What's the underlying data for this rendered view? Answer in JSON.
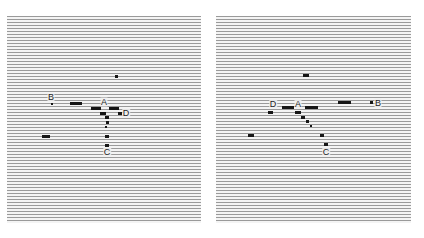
{
  "figure": {
    "panels": [
      {
        "name": "left",
        "labels": [
          {
            "id": "B",
            "text": "B"
          },
          {
            "id": "A",
            "text": "A"
          },
          {
            "id": "D",
            "text": "D"
          },
          {
            "id": "C",
            "text": "C"
          }
        ]
      },
      {
        "name": "right",
        "labels": [
          {
            "id": "D",
            "text": "D"
          },
          {
            "id": "A",
            "text": "A"
          },
          {
            "id": "B",
            "text": "B"
          },
          {
            "id": "C",
            "text": "C"
          }
        ]
      }
    ],
    "colors": {
      "stripe": "#9a9a9a",
      "background": "#f4f4f4",
      "mark": "#161616"
    }
  }
}
